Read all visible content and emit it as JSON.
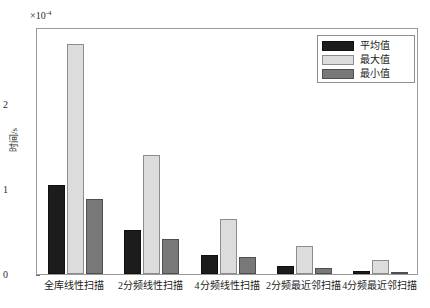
{
  "chart_data": {
    "type": "bar",
    "title": "",
    "xlabel": "",
    "ylabel": "时间/s",
    "y_exponent_prefix": "×10",
    "y_exponent_value": "-4",
    "y_exponent_label": "×10-4",
    "ylim": [
      0,
      2.9
    ],
    "yticks": [
      0,
      1,
      2
    ],
    "ytick_labels": [
      "0",
      "1",
      "2"
    ],
    "grid": false,
    "legend_position": "top-right",
    "categories": [
      "全库线性扫描",
      "2分频线性扫描",
      "4分频线性扫描",
      "2分频最近邻扫描",
      "4分频最近邻扫描"
    ],
    "series": [
      {
        "name": "平均值",
        "color": "#1c1c1c",
        "values": [
          1.05,
          0.52,
          0.22,
          0.09,
          0.04
        ]
      },
      {
        "name": "最大值",
        "color": "#dcdcdc",
        "values": [
          2.7,
          1.4,
          0.65,
          0.33,
          0.17
        ]
      },
      {
        "name": "最小值",
        "color": "#787878",
        "values": [
          0.88,
          0.41,
          0.2,
          0.07,
          0.025
        ]
      }
    ]
  },
  "legend": {
    "items": [
      {
        "label": "平均值"
      },
      {
        "label": "最大值"
      },
      {
        "label": "最小值"
      }
    ]
  },
  "axes": {
    "y_title": "时间/s",
    "exponent_prefix": "×10",
    "exponent_sup": "-4"
  }
}
